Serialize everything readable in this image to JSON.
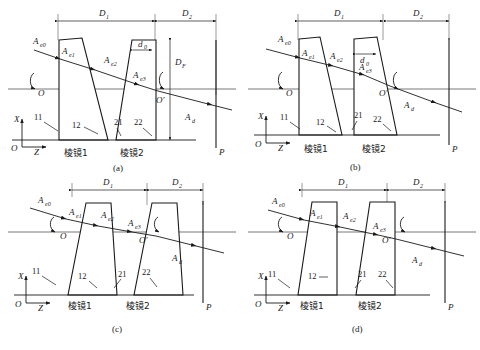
{
  "figure": {
    "panels": [
      {
        "id": "a",
        "caption": "(a)",
        "dimensions": {
          "d1": "D",
          "d1_sub": "1",
          "d2": "D",
          "d2_sub": "2",
          "d0": "d",
          "d0_sub": "0",
          "df": "D",
          "df_sub": "F"
        },
        "rays": [
          {
            "name": "A",
            "sub": "e0"
          },
          {
            "name": "A",
            "sub": "e1"
          },
          {
            "name": "A",
            "sub": "e2"
          },
          {
            "name": "A",
            "sub": "e3"
          },
          {
            "name": "A",
            "sub": "d"
          }
        ],
        "surfaces": [
          "11",
          "12",
          "21",
          "22"
        ],
        "prism_labels": [
          "棱镜1",
          "棱镜2"
        ],
        "points": [
          "O",
          "O'"
        ],
        "screen": "P",
        "axes": {
          "x": "X",
          "z": "Z",
          "origin": "O"
        },
        "prism1_shape": "left-vertical-right-slanted",
        "prism2_shape": "left-slanted-right-vertical",
        "has_df": true,
        "has_d0": true
      },
      {
        "id": "b",
        "caption": "(b)",
        "dimensions": {
          "d1": "D",
          "d1_sub": "1",
          "d2": "D",
          "d2_sub": "2",
          "d0": "d",
          "d0_sub": "0"
        },
        "rays": [
          {
            "name": "A",
            "sub": "e0"
          },
          {
            "name": "A",
            "sub": "e1"
          },
          {
            "name": "A",
            "sub": "e2"
          },
          {
            "name": "A",
            "sub": "e3"
          },
          {
            "name": "A",
            "sub": "d"
          }
        ],
        "surfaces": [
          "11",
          "12",
          "21",
          "22"
        ],
        "prism_labels": [
          "棱镜1",
          "棱镜2"
        ],
        "points": [
          "O",
          "O'"
        ],
        "screen": "P",
        "axes": {
          "x": "X",
          "z": "Z",
          "origin": "O"
        },
        "prism1_shape": "left-vertical-right-slanted",
        "prism2_shape": "left-vertical-right-slanted",
        "has_df": false,
        "has_d0": true
      },
      {
        "id": "c",
        "caption": "(c)",
        "dimensions": {
          "d1": "D",
          "d1_sub": "1",
          "d2": "D",
          "d2_sub": "2"
        },
        "rays": [
          {
            "name": "A",
            "sub": "e0"
          },
          {
            "name": "A",
            "sub": "e1"
          },
          {
            "name": "A",
            "sub": "e2"
          },
          {
            "name": "A",
            "sub": "e3"
          },
          {
            "name": "A",
            "sub": "d"
          }
        ],
        "surfaces": [
          "11",
          "12",
          "21",
          "22"
        ],
        "prism_labels": [
          "棱镜1",
          "棱镜2"
        ],
        "points": [
          "O",
          "O'"
        ],
        "screen": "P",
        "axes": {
          "x": "X",
          "z": "Z",
          "origin": "O"
        },
        "prism1_shape": "left-slanted-right-vertical",
        "prism2_shape": "left-vertical-right-slanted",
        "has_df": false,
        "has_d0": false
      },
      {
        "id": "d",
        "caption": "(d)",
        "dimensions": {
          "d1": "D",
          "d1_sub": "1",
          "d2": "D",
          "d2_sub": "2"
        },
        "rays": [
          {
            "name": "A",
            "sub": "e0"
          },
          {
            "name": "A",
            "sub": "e1"
          },
          {
            "name": "A",
            "sub": "e2"
          },
          {
            "name": "A",
            "sub": "e3"
          },
          {
            "name": "A",
            "sub": "d"
          }
        ],
        "surfaces": [
          "11",
          "12",
          "21",
          "22"
        ],
        "prism_labels": [
          "棱镜1",
          "棱镜2"
        ],
        "points": [
          "O",
          "O'"
        ],
        "screen": "P",
        "axes": {
          "x": "X",
          "z": "Z",
          "origin": "O"
        },
        "prism1_shape": "left-slanted-right-vertical",
        "prism2_shape": "left-slanted-right-vertical",
        "has_df": false,
        "has_d0": false
      }
    ],
    "colors": {
      "line": "#1a1a1a",
      "axis": "#555555",
      "background": "#ffffff"
    }
  }
}
